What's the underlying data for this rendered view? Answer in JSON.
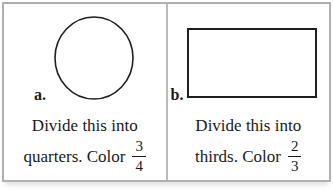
{
  "worksheet": {
    "colors": {
      "frame_border": "#b0b0b0",
      "divider": "#bcbcbc",
      "shape_stroke": "#1f1f1f",
      "text": "#1a1a1a",
      "background": "#ffffff"
    },
    "panels": [
      {
        "label": "a.",
        "shape": "circle",
        "line1": "Divide this into",
        "line2_prefix": "quarters. Color",
        "fraction_numerator": "3",
        "fraction_denominator": "4"
      },
      {
        "label": "b.",
        "shape": "rectangle",
        "line1": "Divide this into",
        "line2_prefix": "thirds. Color",
        "fraction_numerator": "2",
        "fraction_denominator": "3"
      }
    ]
  }
}
